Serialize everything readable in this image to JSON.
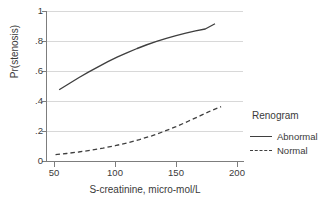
{
  "chart_data": {
    "type": "line",
    "title": "",
    "xlabel": "S-creatinine, micro-mol/L",
    "ylabel": "Pr(stenosis)",
    "xlim": [
      44,
      205
    ],
    "ylim": [
      0,
      1
    ],
    "xticks": [
      50,
      100,
      150,
      200
    ],
    "xtick_labels": [
      "50",
      "100",
      "150",
      "200"
    ],
    "yticks": [
      0,
      0.2,
      0.4,
      0.6,
      0.8,
      1
    ],
    "ytick_labels": [
      "0",
      ".2",
      ".4",
      ".6",
      ".8",
      "1"
    ],
    "grid": "horizontal",
    "legend": {
      "title": "Renogram",
      "position": "right",
      "entries": [
        {
          "label": "Abnormal",
          "style": "solid"
        },
        {
          "label": "Normal",
          "style": "dashed"
        }
      ]
    },
    "series": [
      {
        "name": "Abnormal",
        "style": "solid",
        "color": "#3f3f3f",
        "x": [
          54,
          62,
          70,
          78,
          86,
          94,
          102,
          110,
          118,
          126,
          134,
          142,
          150,
          158,
          166,
          174,
          182
        ],
        "y": [
          0.475,
          0.515,
          0.555,
          0.592,
          0.628,
          0.662,
          0.694,
          0.723,
          0.75,
          0.775,
          0.797,
          0.818,
          0.836,
          0.852,
          0.867,
          0.88,
          0.915
        ]
      },
      {
        "name": "Normal",
        "style": "dashed",
        "color": "#3f3f3f",
        "x": [
          51,
          60,
          70,
          80,
          90,
          100,
          110,
          120,
          130,
          140,
          150,
          160,
          170,
          180,
          187
        ],
        "y": [
          0.042,
          0.05,
          0.06,
          0.072,
          0.086,
          0.102,
          0.121,
          0.143,
          0.168,
          0.197,
          0.229,
          0.265,
          0.302,
          0.34,
          0.362
        ]
      }
    ]
  },
  "style": {
    "grid_color": "#d8d8d8",
    "axis_color": "#7d7d7d",
    "line_color": "#3f3f3f",
    "text_color": "#3a3a3a",
    "background": "#ffffff"
  }
}
